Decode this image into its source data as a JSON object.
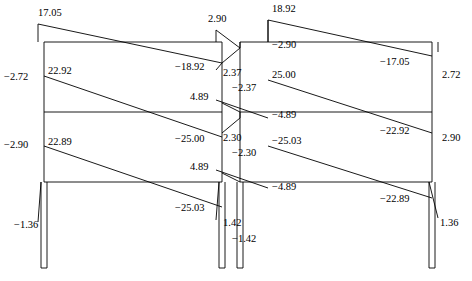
{
  "figure": {
    "type": "structural-bending-moment-diagram",
    "line_color": "#000000",
    "background_color": "#ffffff"
  },
  "frame": {
    "columns_x": [
      44,
      222,
      240,
      432
    ],
    "moment_baseline_x": [
      38,
      216,
      268,
      438
    ],
    "beam_levels_y": [
      42,
      112,
      182
    ],
    "roof_y": 42,
    "base_y": 268
  },
  "labels": [
    {
      "id": "l01",
      "text": "17.05",
      "x": 38,
      "y": 8,
      "align": "left"
    },
    {
      "id": "l02",
      "text": "2.90",
      "x": 208,
      "y": 14,
      "align": "left"
    },
    {
      "id": "l03",
      "text": "18.92",
      "x": 272,
      "y": 4,
      "align": "left"
    },
    {
      "id": "l04",
      "text": "−2.72",
      "x": 4,
      "y": 72,
      "align": "left"
    },
    {
      "id": "l05",
      "text": "22.92",
      "x": 48,
      "y": 66,
      "align": "left"
    },
    {
      "id": "l06",
      "text": "−18.92",
      "x": 175,
      "y": 62,
      "align": "left"
    },
    {
      "id": "l07",
      "text": "2.37",
      "x": 223,
      "y": 68,
      "align": "left"
    },
    {
      "id": "l08",
      "text": "−2.37",
      "x": 232,
      "y": 83,
      "align": "left"
    },
    {
      "id": "l09",
      "text": "−2.90",
      "x": 272,
      "y": 40,
      "align": "left"
    },
    {
      "id": "l10",
      "text": "25.00",
      "x": 272,
      "y": 70,
      "align": "left"
    },
    {
      "id": "l11",
      "text": "−17.05",
      "x": 380,
      "y": 57,
      "align": "left"
    },
    {
      "id": "l12",
      "text": "2.72",
      "x": 442,
      "y": 70,
      "align": "left"
    },
    {
      "id": "l13",
      "text": "4.89",
      "x": 190,
      "y": 92,
      "align": "left"
    },
    {
      "id": "l14",
      "text": "−4.89",
      "x": 272,
      "y": 110,
      "align": "left"
    },
    {
      "id": "l15",
      "text": "−2.90",
      "x": 4,
      "y": 140,
      "align": "left"
    },
    {
      "id": "l16",
      "text": "22.89",
      "x": 48,
      "y": 137,
      "align": "left"
    },
    {
      "id": "l17",
      "text": "−25.00",
      "x": 175,
      "y": 134,
      "align": "left"
    },
    {
      "id": "l18",
      "text": "2.30",
      "x": 223,
      "y": 133,
      "align": "left"
    },
    {
      "id": "l19",
      "text": "−2.30",
      "x": 232,
      "y": 148,
      "align": "left"
    },
    {
      "id": "l20",
      "text": "−25.03",
      "x": 272,
      "y": 136,
      "align": "left"
    },
    {
      "id": "l21",
      "text": "−22.92",
      "x": 380,
      "y": 126,
      "align": "left"
    },
    {
      "id": "l22",
      "text": "2.90",
      "x": 442,
      "y": 133,
      "align": "left"
    },
    {
      "id": "l23",
      "text": "4.89",
      "x": 190,
      "y": 162,
      "align": "left"
    },
    {
      "id": "l24",
      "text": "−4.89",
      "x": 272,
      "y": 182,
      "align": "left"
    },
    {
      "id": "l25",
      "text": "−25.03",
      "x": 175,
      "y": 203,
      "align": "left"
    },
    {
      "id": "l26",
      "text": "−22.89",
      "x": 380,
      "y": 194,
      "align": "left"
    },
    {
      "id": "l27",
      "text": "−1.36",
      "x": 14,
      "y": 220,
      "align": "left"
    },
    {
      "id": "l28",
      "text": "1.42",
      "x": 223,
      "y": 218,
      "align": "left"
    },
    {
      "id": "l29",
      "text": "−1.42",
      "x": 232,
      "y": 234,
      "align": "left"
    },
    {
      "id": "l30",
      "text": "1.36",
      "x": 440,
      "y": 218,
      "align": "left"
    }
  ],
  "chart_data": {
    "type": "diagram",
    "title": "",
    "units": "kNm",
    "storeys": [
      {
        "name": "roof-level",
        "left_column_top": 17.05,
        "beam_left_end": 17.05,
        "beam_right_end": -18.92,
        "mid_column_top_left": 2.9,
        "mid_column_top_right": 18.92,
        "second_beam_left_end": -2.9,
        "second_beam_right_end": -17.05,
        "right_column_top": 2.72
      },
      {
        "name": "second-floor",
        "left_column": -2.72,
        "left_beam_start": 22.92,
        "left_beam_end": -25.0,
        "mid_column_left": 2.37,
        "mid_column_right": -2.37,
        "mid_bay_left": 25.0,
        "mid_bay_right": -22.92,
        "right_column": 2.9,
        "shear_left": 4.89,
        "shear_right": -4.89
      },
      {
        "name": "first-floor",
        "left_column": -2.9,
        "left_beam_start": 22.89,
        "left_beam_end": -25.03,
        "mid_column_left": 2.3,
        "mid_column_right": -2.3,
        "mid_bay_left": -25.03,
        "mid_bay_right": -22.89,
        "right_column": 2.9,
        "shear_left": 4.89,
        "shear_right": -4.89
      },
      {
        "name": "ground-base",
        "left_base": -1.36,
        "mid_base_left": 1.42,
        "mid_base_right": -1.42,
        "right_base": 1.36
      }
    ],
    "all_values": [
      17.05,
      2.9,
      18.92,
      -2.72,
      22.92,
      -18.92,
      2.37,
      -2.37,
      -2.9,
      25.0,
      -17.05,
      2.72,
      4.89,
      -4.89,
      -2.9,
      22.89,
      -25.0,
      2.3,
      -2.3,
      -25.03,
      -22.92,
      2.9,
      4.89,
      -4.89,
      -25.03,
      -22.89,
      -1.36,
      1.42,
      -1.42,
      1.36
    ]
  }
}
